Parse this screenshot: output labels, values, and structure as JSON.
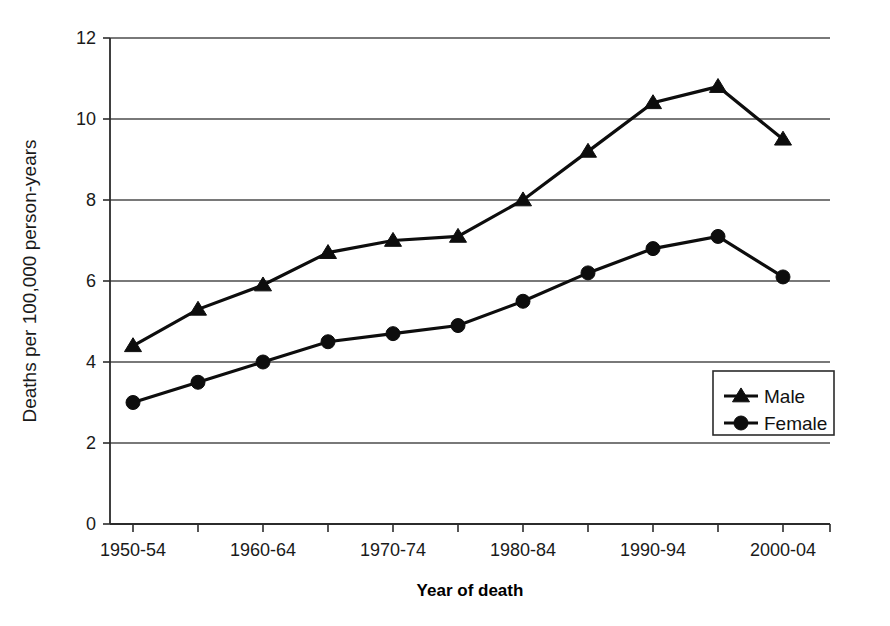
{
  "chart_data": {
    "type": "line",
    "title": "",
    "xlabel": "Year of death",
    "ylabel": "Deaths per 100,000 person-years",
    "categories": [
      "1950-54",
      "1955-59",
      "1960-64",
      "1965-69",
      "1970-74",
      "1975-79",
      "1980-84",
      "1985-89",
      "1990-94",
      "1995-99",
      "2000-04"
    ],
    "xtick_labels": [
      "1950-54",
      "1960-64",
      "1970-74",
      "1980-84",
      "1990-94",
      "2000-04"
    ],
    "ytick_labels": [
      "0",
      "2",
      "4",
      "6",
      "8",
      "10",
      "12"
    ],
    "ylim": [
      0,
      12
    ],
    "ytick_values": [
      0,
      2,
      4,
      6,
      8,
      10,
      12
    ],
    "grid": true,
    "legend_position": "bottom-right",
    "series": [
      {
        "name": "Male",
        "marker": "triangle",
        "values": [
          4.4,
          5.3,
          5.9,
          6.7,
          7.0,
          7.1,
          8.0,
          9.2,
          10.4,
          10.8,
          9.5
        ]
      },
      {
        "name": "Female",
        "marker": "circle",
        "values": [
          3.0,
          3.5,
          4.0,
          4.5,
          4.7,
          4.9,
          5.5,
          6.2,
          6.8,
          7.1,
          6.1
        ]
      }
    ],
    "colors": {
      "series": "#0d0d0d",
      "grid": "#4d4d4d",
      "axis": "#2b2b2b",
      "background": "#ffffff"
    }
  },
  "axes": {
    "y_axis_title": "Deaths per 100,000 person-years",
    "x_axis_title": "Year of death"
  },
  "legend": {
    "entries": [
      {
        "label": "Male"
      },
      {
        "label": "Female"
      }
    ]
  }
}
